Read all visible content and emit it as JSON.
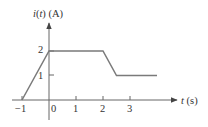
{
  "chart_data": {
    "type": "line",
    "title": "",
    "xlabel": "t (s)",
    "ylabel": "i(t) (A)",
    "ylabel_parts": {
      "var": "i",
      "open": "(",
      "arg": "t",
      "close": ")",
      "unit": " (A)"
    },
    "xlabel_parts": {
      "var": "t",
      "unit": " (s)"
    },
    "x": [
      -1,
      0,
      2,
      2.5,
      4
    ],
    "y": [
      0,
      2,
      2,
      1,
      1
    ],
    "series": [
      {
        "name": "i(t)",
        "x": [
          -1,
          0,
          2,
          2.5,
          4
        ],
        "values": [
          0,
          2,
          2,
          1,
          1
        ]
      }
    ],
    "x_ticks": [
      -1,
      0,
      1,
      2,
      3
    ],
    "x_tick_labels": [
      "−1",
      "0",
      "1",
      "2",
      "3"
    ],
    "y_ticks": [
      1,
      2
    ],
    "y_tick_labels": [
      "1",
      "2"
    ],
    "xlim": [
      -1.4,
      4.8
    ],
    "ylim": [
      -0.8,
      3.2
    ],
    "grid": false,
    "legend": null,
    "line_color": "#7a7a7a",
    "axis_color": "#555555"
  }
}
